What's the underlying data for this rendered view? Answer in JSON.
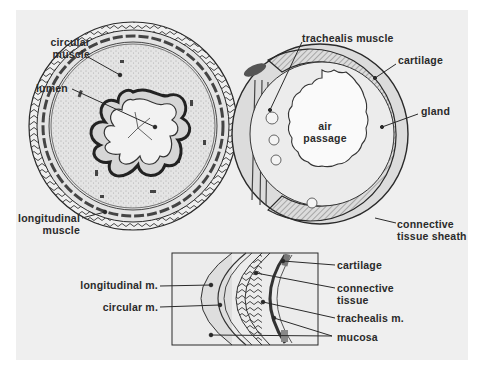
{
  "figure": {
    "type": "anatomical cross-section diagram",
    "colors": {
      "paper": "#efefef",
      "ink": "#2a2a2a",
      "background": "#ffffff"
    }
  },
  "esophagus": {
    "labels": {
      "circular_muscle": [
        "circular",
        "muscle"
      ],
      "lumen": "lumen",
      "longitudinal_muscle": [
        "longitudinal",
        "muscle"
      ]
    }
  },
  "trachea": {
    "labels": {
      "trachealis_muscle": "trachealis muscle",
      "cartilage": "cartilage",
      "gland": "gland",
      "air_passage": [
        "air",
        "passage"
      ],
      "connective_tissue_sheath": [
        "connective",
        "tissue sheath"
      ]
    }
  },
  "inset": {
    "labels": {
      "longitudinal_m": "longitudinal m.",
      "circular_m": "circular m.",
      "cartilage": "cartilage",
      "connective_tissue": [
        "connective",
        "tissue"
      ],
      "trachealis_m": "trachealis m.",
      "mucosa": "mucosa"
    }
  }
}
